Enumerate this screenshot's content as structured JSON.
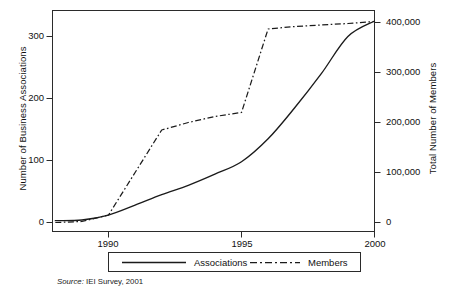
{
  "chart_data": {
    "type": "line",
    "title": "",
    "xlabel": "",
    "ylabel": "Number of Business Associations",
    "y2label": "Total Number of Members",
    "xlim": [
      1988,
      2000
    ],
    "ylim": [
      0,
      325
    ],
    "y2lim": [
      0,
      420000
    ],
    "grid": false,
    "legend_position": "bottom-center",
    "x_ticks": [
      1990,
      1995,
      2000
    ],
    "x_tick_labels": [
      "1990",
      "1995",
      "2000"
    ],
    "y_ticks": [
      0,
      100,
      200,
      300
    ],
    "y_tick_labels": [
      "0",
      "100",
      "200",
      "300"
    ],
    "y2_ticks": [
      0,
      100000,
      200000,
      300000,
      400000
    ],
    "y2_tick_labels": [
      "0",
      "100,000",
      "200,000",
      "300,000",
      "400,000"
    ],
    "x": [
      1988,
      1989,
      1990,
      1991,
      1992,
      1993,
      1994,
      1995,
      1996,
      1997,
      1998,
      1999,
      2000
    ],
    "series": [
      {
        "name": "Associations",
        "axis": "left",
        "style": "solid",
        "values": [
          3,
          4,
          12,
          28,
          45,
          60,
          78,
          98,
          135,
          185,
          240,
          300,
          325
        ]
      },
      {
        "name": "Members",
        "axis": "right",
        "style": "dash-dot",
        "values": [
          0,
          2000,
          15000,
          100000,
          185000,
          200000,
          212000,
          220000,
          387000,
          392000,
          395000,
          398000,
          402000
        ]
      }
    ],
    "annotations": [],
    "source": {
      "prefix": "Source:",
      "text": "IEI Survey, 2001"
    }
  },
  "axes": {
    "left": {
      "title": "Number of Business Associations"
    },
    "right": {
      "title": "Total Number of Members"
    }
  },
  "legend": {
    "items": [
      {
        "label": "Associations",
        "style": "solid"
      },
      {
        "label": "Members",
        "style": "dash-dot"
      }
    ]
  }
}
